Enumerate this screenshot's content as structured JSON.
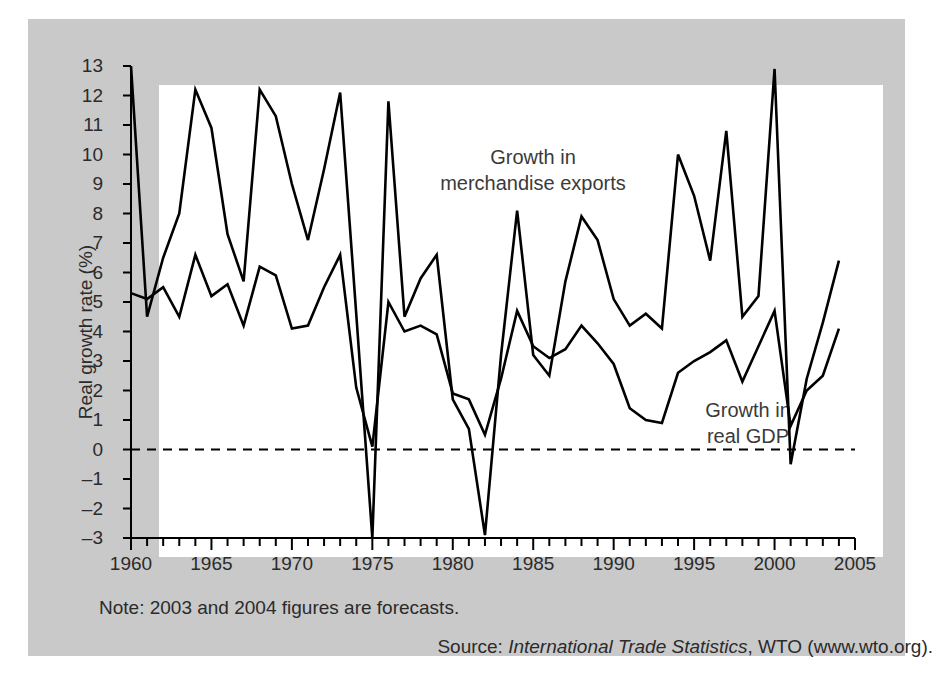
{
  "figure": {
    "note": "Note: 2003 and 2004 figures are forecasts.",
    "source_prefix": "Source: ",
    "source_italic": "International Trade Statistics",
    "source_suffix": ", WTO (www.wto.org).",
    "panel_bg": "#c9c9c9",
    "plot_bg": "#ffffff",
    "line_color": "#000000"
  },
  "annotations": {
    "exports_line1": "Growth in",
    "exports_line2": "merchandise exports",
    "gdp_line1": "Growth in",
    "gdp_line2": "real GDP"
  },
  "chart_data": {
    "type": "line",
    "title": "",
    "xlabel": "",
    "ylabel": "Real growth rate (%)",
    "xlim": [
      1960,
      2005
    ],
    "ylim": [
      -3,
      13
    ],
    "grid": false,
    "legend": "inline-annotations",
    "zero_line": 0,
    "zero_line_style": "dashed",
    "ytick_labels": [
      "13",
      "12",
      "11",
      "10",
      "9",
      "8",
      "7",
      "6",
      "5",
      "4",
      "3",
      "2",
      "1",
      "0",
      "-1",
      "-2",
      "-3"
    ],
    "ytick_values": [
      13,
      12,
      11,
      10,
      9,
      8,
      7,
      6,
      5,
      4,
      3,
      2,
      1,
      0,
      -1,
      -2,
      -3
    ],
    "xtick_labels": [
      "1960",
      "1965",
      "1970",
      "1975",
      "1980",
      "1985",
      "1990",
      "1995",
      "2000",
      "2005"
    ],
    "xtick_values": [
      1960,
      1965,
      1970,
      1975,
      1980,
      1985,
      1990,
      1995,
      2000,
      2005
    ],
    "x": [
      1960,
      1961,
      1962,
      1963,
      1964,
      1965,
      1966,
      1967,
      1968,
      1969,
      1970,
      1971,
      1972,
      1973,
      1974,
      1975,
      1976,
      1977,
      1978,
      1979,
      1980,
      1981,
      1982,
      1983,
      1984,
      1985,
      1986,
      1987,
      1988,
      1989,
      1990,
      1991,
      1992,
      1993,
      1994,
      1995,
      1996,
      1997,
      1998,
      1999,
      2000,
      2001,
      2002,
      2003,
      2004
    ],
    "series": [
      {
        "name": "Growth in merchandise exports",
        "values": [
          13.0,
          4.5,
          6.5,
          8.0,
          12.2,
          10.9,
          7.3,
          5.7,
          12.2,
          11.3,
          9.0,
          7.1,
          9.5,
          12.1,
          4.6,
          -3.0,
          11.8,
          4.5,
          5.8,
          6.6,
          1.7,
          0.7,
          -2.9,
          3.2,
          8.1,
          3.2,
          2.5,
          5.7,
          7.9,
          7.1,
          5.1,
          4.2,
          4.6,
          4.1,
          10.0,
          8.6,
          6.4,
          10.8,
          4.5,
          5.2,
          12.9,
          -0.5,
          2.4,
          4.3,
          6.4
        ]
      },
      {
        "name": "Growth in real GDP",
        "values": [
          5.3,
          5.1,
          5.5,
          4.5,
          6.6,
          5.2,
          5.6,
          4.2,
          6.2,
          5.9,
          4.1,
          4.2,
          5.5,
          6.6,
          2.1,
          0.1,
          5.0,
          4.0,
          4.2,
          3.9,
          1.9,
          1.7,
          0.5,
          2.4,
          4.7,
          3.5,
          3.1,
          3.4,
          4.2,
          3.6,
          2.9,
          1.4,
          1.0,
          0.9,
          2.6,
          3.0,
          3.3,
          3.7,
          2.3,
          3.5,
          4.7,
          0.8,
          2.0,
          2.5,
          4.1
        ]
      }
    ]
  }
}
